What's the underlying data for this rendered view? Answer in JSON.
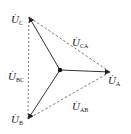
{
  "diagram": {
    "title": "",
    "type": "three-phase voltage phasor diagram",
    "colors": {
      "line": "#333333",
      "dashed": "#555555",
      "background": "#ffffff"
    },
    "center": {
      "x": 60,
      "y": 70
    },
    "phasors": [
      {
        "id": "A",
        "symbol": "U",
        "sub": "A",
        "tip": {
          "x": 110,
          "y": 72
        },
        "style": "solid"
      },
      {
        "id": "B",
        "symbol": "U",
        "sub": "B",
        "tip": {
          "x": 28,
          "y": 119
        },
        "style": "solid"
      },
      {
        "id": "C",
        "symbol": "U",
        "sub": "C",
        "tip": {
          "x": 29,
          "y": 17
        },
        "style": "solid"
      }
    ],
    "line_voltages": [
      {
        "id": "CA",
        "symbol": "U",
        "sub": "CA",
        "from": "A",
        "to": "C",
        "style": "dashed"
      },
      {
        "id": "BC",
        "symbol": "U",
        "sub": "BC",
        "from": "B",
        "to": "C",
        "style": "dashed"
      },
      {
        "id": "AB",
        "symbol": "U",
        "sub": "AB",
        "from": "A",
        "to": "B",
        "style": "dashed"
      }
    ],
    "labels": {
      "UA": {
        "main": "U",
        "sub": "A",
        "dot": "·"
      },
      "UB": {
        "main": "U",
        "sub": "B",
        "dot": "·"
      },
      "UC": {
        "main": "U",
        "sub": "C",
        "dot": "·"
      },
      "UCA": {
        "main": "U",
        "sub": "CA",
        "dot": "·"
      },
      "UBC": {
        "main": "U",
        "sub": "BC",
        "dot": "·"
      },
      "UAB": {
        "main": "U",
        "sub": "AB",
        "dot": "·"
      }
    }
  }
}
